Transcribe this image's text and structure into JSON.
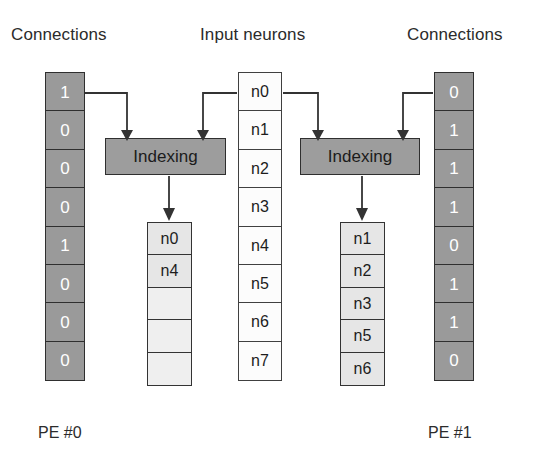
{
  "headers": {
    "connections_left": "Connections",
    "input_neurons": "Input neurons",
    "connections_right": "Connections"
  },
  "footers": {
    "pe_left": "PE #0",
    "pe_right": "PE #1"
  },
  "colors": {
    "background": "#ffffff",
    "connection_cell_fill": "#9a9a9a",
    "connection_cell_text": "#ffffff",
    "neuron_cell_fill": "#fcfcfc",
    "result_cell_fill": "#e6e6e6",
    "indexing_box_fill": "#9d9d9d",
    "stroke": "#333333",
    "text": "#231f20"
  },
  "connections_left": {
    "label": "Connections",
    "bits": [
      "1",
      "0",
      "0",
      "0",
      "1",
      "0",
      "0",
      "0"
    ]
  },
  "connections_right": {
    "label": "Connections",
    "bits": [
      "0",
      "1",
      "1",
      "1",
      "0",
      "1",
      "1",
      "0"
    ]
  },
  "input_neurons": {
    "label": "Input neurons",
    "items": [
      "n0",
      "n1",
      "n2",
      "n3",
      "n4",
      "n5",
      "n6",
      "n7"
    ]
  },
  "indexing": {
    "left_label": "Indexing",
    "right_label": "Indexing"
  },
  "result_left": {
    "items": [
      "n0",
      "n4",
      "",
      "",
      ""
    ]
  },
  "result_right": {
    "items": [
      "n1",
      "n2",
      "n3",
      "n5",
      "n6"
    ]
  }
}
